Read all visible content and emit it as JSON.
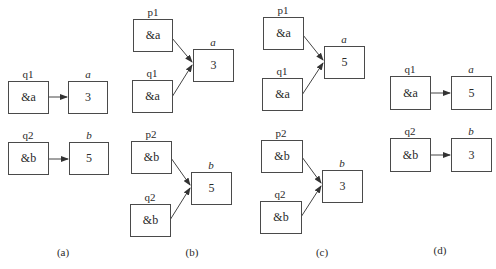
{
  "panels": [
    {
      "caption": "(a)",
      "pointers": [
        {
          "name": "q1",
          "value": "&a"
        },
        {
          "name": "q2",
          "value": "&b"
        }
      ],
      "variables": [
        {
          "name": "a",
          "value": "3"
        },
        {
          "name": "b",
          "value": "5"
        }
      ]
    },
    {
      "caption": "(b)",
      "pointers": [
        {
          "name": "p1",
          "value": "&a"
        },
        {
          "name": "q1",
          "value": "&a"
        },
        {
          "name": "p2",
          "value": "&b"
        },
        {
          "name": "q2",
          "value": "&b"
        }
      ],
      "variables": [
        {
          "name": "a",
          "value": "3"
        },
        {
          "name": "b",
          "value": "5"
        }
      ]
    },
    {
      "caption": "(c)",
      "pointers": [
        {
          "name": "p1",
          "value": "&a"
        },
        {
          "name": "q1",
          "value": "&a"
        },
        {
          "name": "p2",
          "value": "&b"
        },
        {
          "name": "q2",
          "value": "&b"
        }
      ],
      "variables": [
        {
          "name": "a",
          "value": "5"
        },
        {
          "name": "b",
          "value": "3"
        }
      ]
    },
    {
      "caption": "(d)",
      "pointers": [
        {
          "name": "q1",
          "value": "&a"
        },
        {
          "name": "q2",
          "value": "&b"
        }
      ],
      "variables": [
        {
          "name": "a",
          "value": "5"
        },
        {
          "name": "b",
          "value": "3"
        }
      ]
    }
  ],
  "colors": {
    "line": "#4a4a4a",
    "text": "#2a2a2a",
    "background": "#ffffff"
  }
}
